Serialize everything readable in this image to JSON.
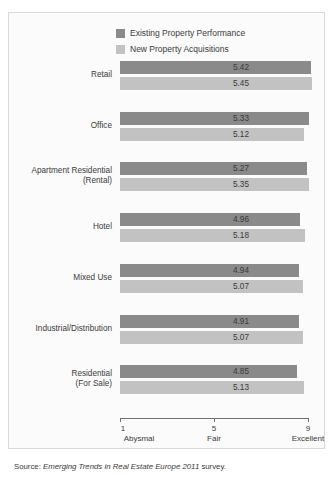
{
  "legend": {
    "items": [
      {
        "label": "Existing Property Performance",
        "color": "#8a8a8a",
        "name": "legend-existing"
      },
      {
        "label": "New Property Acquisitions",
        "color": "#c2c2c2",
        "name": "legend-new"
      }
    ]
  },
  "source": {
    "prefix": "Source: ",
    "title": "Emerging Trends in Real Estate Europe 2011",
    "suffix": " survey."
  },
  "chart_data": {
    "type": "bar",
    "orientation": "horizontal",
    "title": "",
    "xlabel": "",
    "ylabel": "",
    "xlim": [
      1,
      9
    ],
    "grid": false,
    "legend_position": "top",
    "ticks": [
      {
        "value": 1,
        "label": "1",
        "caption": "Abysmal"
      },
      {
        "value": 5,
        "label": "5",
        "caption": "Fair"
      },
      {
        "value": 9,
        "label": "9",
        "caption": "Excellent"
      }
    ],
    "categories": [
      {
        "line1": "Retail",
        "line2": ""
      },
      {
        "line1": "Office",
        "line2": ""
      },
      {
        "line1": "Apartment Residential",
        "line2": "(Rental)"
      },
      {
        "line1": "Hotel",
        "line2": ""
      },
      {
        "line1": "Mixed Use",
        "line2": ""
      },
      {
        "line1": "Industrial/Distribution",
        "line2": ""
      },
      {
        "line1": "Residential",
        "line2": "(For Sale)"
      }
    ],
    "series": [
      {
        "name": "Existing Property Performance",
        "color": "#8a8a8a",
        "values": [
          5.42,
          5.33,
          5.27,
          4.96,
          4.94,
          4.91,
          4.85
        ],
        "labels": [
          "5.42",
          "5.33",
          "5.27",
          "4.96",
          "4.94",
          "4.91",
          "4.85"
        ]
      },
      {
        "name": "New Property Acquisitions",
        "color": "#c2c2c2",
        "values": [
          5.45,
          5.12,
          5.35,
          5.18,
          5.07,
          5.07,
          5.13
        ],
        "labels": [
          "5.45",
          "5.12",
          "5.35",
          "5.18",
          "5.07",
          "5.07",
          "5.13"
        ]
      }
    ]
  }
}
